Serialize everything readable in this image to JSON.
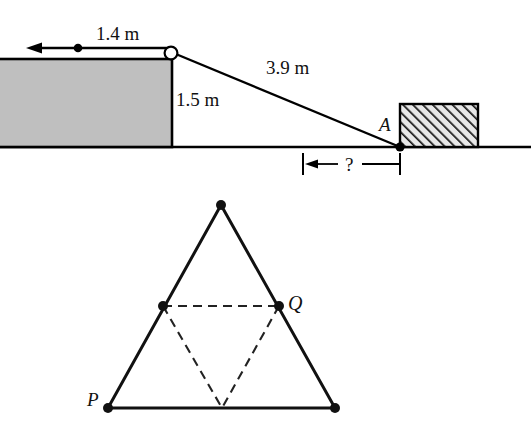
{
  "figure_top": {
    "name": "pulley-incline-diagram",
    "labels": {
      "distance_top": "1.4 m",
      "height": "1.5 m",
      "slope_length": "3.9 m",
      "point_a": "A",
      "unknown_distance": "?"
    },
    "elements": {
      "grey_block": "shaded-rectangular-block",
      "pulley": "small-circle-pulley",
      "particle": "dot-on-string",
      "arrow_direction": "left",
      "hatched_block": "hatched-rectangular-block",
      "ground": "ground-line"
    },
    "colors": {
      "grey_fill": "#bfbfbf",
      "line": "#000000",
      "hatch": "#1a1a1a"
    }
  },
  "figure_bottom": {
    "name": "triangle-midpoints-diagram",
    "labels": {
      "vertex_p": "P",
      "vertex_q": "Q"
    },
    "elements": {
      "outer_triangle": "solid-equilateral-triangle",
      "inner_triangle": "dashed-inverted-triangle",
      "vertex_dots": "filled-circle-markers"
    },
    "colors": {
      "line": "#111111",
      "dashed": "#222222"
    }
  }
}
